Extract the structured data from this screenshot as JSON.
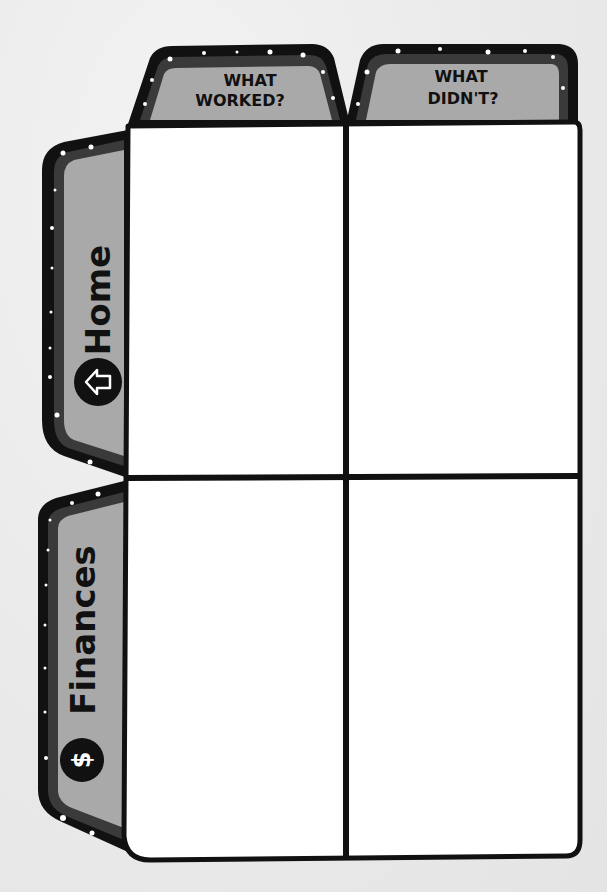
{
  "columns": [
    {
      "line1": "WHAT",
      "line2": "WORKED?"
    },
    {
      "line1": "WHAT",
      "line2": "DIDN'T?"
    }
  ],
  "rows": [
    {
      "label": "Home",
      "icon": "home-arrow-icon"
    },
    {
      "label": "Finances",
      "icon": "dollar-icon"
    }
  ],
  "cells": [
    {
      "row": "Home",
      "column": "WHAT WORKED?",
      "text": ""
    },
    {
      "row": "Home",
      "column": "WHAT DIDN'T?",
      "text": ""
    },
    {
      "row": "Finances",
      "column": "WHAT WORKED?",
      "text": ""
    },
    {
      "row": "Finances",
      "column": "WHAT DIDN'T?",
      "text": ""
    }
  ],
  "colors": {
    "outline": "#111111",
    "tab_fill": "#a9a9a9",
    "tab_border": "#3a3a3a",
    "cell_fill": "#ffffff",
    "background": "#ececec"
  }
}
